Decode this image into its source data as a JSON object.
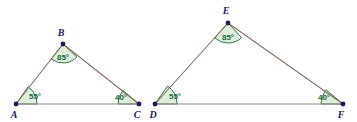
{
  "figure": {
    "width": 357,
    "height": 122,
    "background_color": "#ffffff"
  },
  "style": {
    "edge_color": "#8a7060",
    "base_color": "#9a8a8a",
    "vertex_color": "#1a1a5e",
    "arc_stroke_color": "#2f7a46",
    "arc_fill_color": "#ddeedd",
    "angle_text_color": "#1a6b3c",
    "edge_width": 1.1,
    "arc_width": 1.0,
    "vertex_radius": 2.4
  },
  "triangles": [
    {
      "id": "triangle-abc",
      "name": "ABC",
      "vertices": [
        {
          "label": "A",
          "x": 16,
          "y": 104,
          "label_x": 14,
          "label_y": 118,
          "angle": "55°",
          "angle_label_x": 35,
          "angle_label_y": 99,
          "arc_radius": 21,
          "start_deg": 0,
          "end_deg": 55
        },
        {
          "label": "B",
          "x": 63,
          "y": 44,
          "label_x": 61,
          "label_y": 36,
          "angle": "85°",
          "angle_label_x": 63,
          "angle_label_y": 60,
          "arc_radius": 19,
          "start_deg": 232,
          "end_deg": 317
        },
        {
          "label": "C",
          "x": 139,
          "y": 104,
          "label_x": 137,
          "label_y": 118,
          "angle": "40°",
          "angle_label_x": 121,
          "angle_label_y": 100,
          "arc_radius": 21,
          "start_deg": 140,
          "end_deg": 180
        }
      ],
      "edges": [
        {
          "name": "edge-AB",
          "from": "A",
          "to": "B",
          "kind": "slant"
        },
        {
          "name": "edge-BC",
          "from": "B",
          "to": "C",
          "kind": "slant"
        },
        {
          "name": "edge-AC",
          "from": "A",
          "to": "C",
          "kind": "base"
        }
      ]
    },
    {
      "id": "triangle-def",
      "name": "DEF",
      "vertices": [
        {
          "label": "D",
          "x": 155,
          "y": 104,
          "label_x": 153,
          "label_y": 118,
          "angle": "55°",
          "angle_label_x": 175,
          "angle_label_y": 99,
          "arc_radius": 22,
          "start_deg": 0,
          "end_deg": 55
        },
        {
          "label": "E",
          "x": 228,
          "y": 23,
          "label_x": 226,
          "label_y": 14,
          "angle": "85°",
          "angle_label_x": 228,
          "angle_label_y": 40,
          "arc_radius": 20,
          "start_deg": 228,
          "end_deg": 313
        },
        {
          "label": "F",
          "x": 343,
          "y": 104,
          "label_x": 341,
          "label_y": 118,
          "angle": "40°",
          "angle_label_x": 324,
          "angle_label_y": 100,
          "arc_radius": 22,
          "start_deg": 140,
          "end_deg": 180
        }
      ],
      "edges": [
        {
          "name": "edge-DE",
          "from": "D",
          "to": "E",
          "kind": "slant"
        },
        {
          "name": "edge-EF",
          "from": "E",
          "to": "F",
          "kind": "slant"
        },
        {
          "name": "edge-DF",
          "from": "D",
          "to": "F",
          "kind": "base"
        }
      ]
    }
  ],
  "angle_measures": {
    "apex": "85°",
    "left_base": "55°",
    "right_base": "40°"
  }
}
